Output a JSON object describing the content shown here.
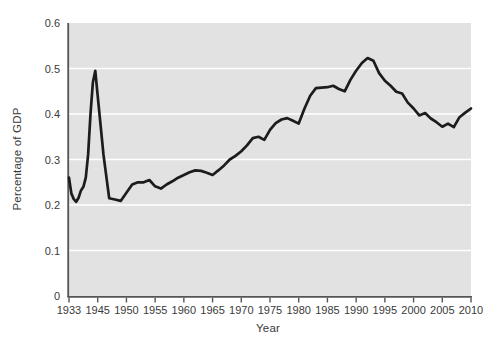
{
  "page": {
    "background": "#ffffff"
  },
  "chart_data": {
    "type": "line",
    "title": "",
    "xlabel": "Year",
    "ylabel": "Percentage of GDP",
    "legend": "none",
    "grid": "horizontal white gridlines on gray plot background",
    "ylim": [
      0,
      0.6
    ],
    "y_tick_values": [
      0,
      0.1,
      0.2,
      0.3,
      0.4,
      0.5,
      0.6
    ],
    "y_tick_labels": [
      "0",
      "0.1",
      "0.2",
      "0.3",
      "0.4",
      "0.5",
      "0.6"
    ],
    "x_tick_labels": [
      "1933",
      "1945",
      "1950",
      "1955",
      "1960",
      "1965",
      "1970",
      "1975",
      "1980",
      "1985",
      "1990",
      "1995",
      "2000",
      "2005",
      "2010"
    ],
    "x_axis_note": "ticks evenly spaced; first interval spans 1933-1945, all later intervals span 5 years",
    "series": [
      {
        "name": "Percentage of GDP",
        "x": [
          1933,
          1934,
          1935,
          1936,
          1937,
          1938,
          1939,
          1940,
          1941,
          1942,
          1943,
          1944,
          1945,
          1946,
          1947,
          1948,
          1949,
          1950,
          1951,
          1952,
          1953,
          1954,
          1955,
          1956,
          1957,
          1958,
          1959,
          1960,
          1961,
          1962,
          1963,
          1964,
          1965,
          1966,
          1967,
          1968,
          1969,
          1970,
          1971,
          1972,
          1973,
          1974,
          1975,
          1976,
          1977,
          1978,
          1979,
          1980,
          1981,
          1982,
          1983,
          1984,
          1985,
          1986,
          1987,
          1988,
          1989,
          1990,
          1991,
          1992,
          1993,
          1994,
          1995,
          1996,
          1997,
          1998,
          1999,
          2000,
          2001,
          2002,
          2003,
          2004,
          2005,
          2006,
          2007,
          2008,
          2009,
          2010
        ],
        "y": [
          0.26,
          0.225,
          0.213,
          0.207,
          0.216,
          0.232,
          0.24,
          0.26,
          0.31,
          0.4,
          0.47,
          0.495,
          0.44,
          0.31,
          0.215,
          0.212,
          0.209,
          0.227,
          0.245,
          0.25,
          0.25,
          0.255,
          0.241,
          0.236,
          0.245,
          0.252,
          0.26,
          0.266,
          0.272,
          0.276,
          0.275,
          0.271,
          0.266,
          0.276,
          0.287,
          0.3,
          0.308,
          0.318,
          0.331,
          0.347,
          0.35,
          0.343,
          0.365,
          0.38,
          0.388,
          0.391,
          0.385,
          0.379,
          0.412,
          0.44,
          0.457,
          0.458,
          0.459,
          0.462,
          0.455,
          0.45,
          0.475,
          0.495,
          0.512,
          0.523,
          0.517,
          0.49,
          0.473,
          0.462,
          0.449,
          0.445,
          0.425,
          0.412,
          0.397,
          0.402,
          0.39,
          0.382,
          0.372,
          0.379,
          0.371,
          0.393,
          0.403,
          0.412
        ]
      }
    ],
    "colors": {
      "line": "#1c1c1c",
      "plot_background": "#e2e2e2",
      "gridline": "#ffffff",
      "axis": "#555555",
      "tick_text": "#3a3a3a"
    }
  }
}
